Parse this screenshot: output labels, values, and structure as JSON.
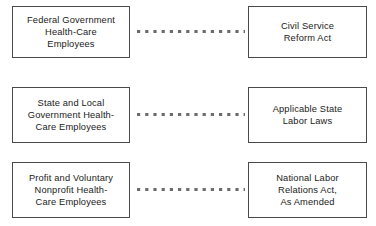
{
  "diagram": {
    "background_color": "#ffffff",
    "border_color": "#4a4a4a",
    "text_color": "#1a1a1a",
    "connector_color": "#6b6b6b",
    "connector_style": "dotted",
    "rows": [
      {
        "source": "Federal Government\nHealth-Care\nEmployees",
        "target": "Civil Service\nReform Act"
      },
      {
        "source": "State and Local\nGovernment Health-\nCare Employees",
        "target": "Applicable State\nLabor Laws"
      },
      {
        "source": "Profit and Voluntary\nNonprofit Health-\nCare Employees",
        "target": "National Labor\nRelations Act,\nAs Amended"
      }
    ]
  }
}
